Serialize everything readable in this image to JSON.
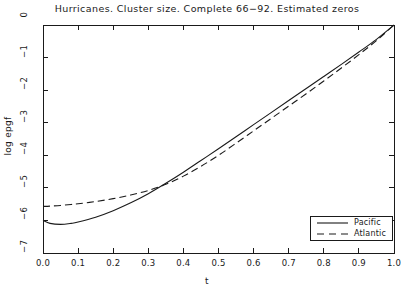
{
  "chart_data": {
    "type": "line",
    "title": "Hurricanes. Cluster size. Complete 66−92. Estimated zeros",
    "xlabel": "t",
    "ylabel": "log epgf",
    "xlim": [
      0.0,
      1.0
    ],
    "ylim": [
      -7,
      0
    ],
    "xticks": [
      "0.0",
      "0.1",
      "0.2",
      "0.3",
      "0.4",
      "0.5",
      "0.6",
      "0.7",
      "0.8",
      "0.9",
      "1.0"
    ],
    "xtick_values": [
      0.0,
      0.1,
      0.2,
      0.3,
      0.4,
      0.5,
      0.6,
      0.7,
      0.8,
      0.9,
      1.0
    ],
    "yticks": [
      "0",
      "−1",
      "−2",
      "−3",
      "−4",
      "−5",
      "−6",
      "−7"
    ],
    "ytick_values": [
      0,
      -1,
      -2,
      -3,
      -4,
      -5,
      -6,
      -7
    ],
    "grid": false,
    "legend_position": "lower right",
    "series": [
      {
        "name": "Pacific",
        "style": "solid",
        "color": "#1a1a1a",
        "x": [
          0.0,
          0.02,
          0.05,
          0.08,
          0.1,
          0.15,
          0.2,
          0.25,
          0.3,
          0.35,
          0.4,
          0.45,
          0.5,
          0.55,
          0.6,
          0.65,
          0.7,
          0.75,
          0.8,
          0.85,
          0.9,
          0.95,
          1.0
        ],
        "values": [
          -6.0,
          -6.09,
          -6.12,
          -6.09,
          -6.05,
          -5.9,
          -5.7,
          -5.46,
          -5.18,
          -4.86,
          -4.52,
          -4.16,
          -3.8,
          -3.43,
          -3.06,
          -2.69,
          -2.32,
          -1.95,
          -1.58,
          -1.21,
          -0.83,
          -0.44,
          0.0
        ]
      },
      {
        "name": "Atlantic",
        "style": "dashed",
        "color": "#1a1a1a",
        "x": [
          0.0,
          0.02,
          0.05,
          0.08,
          0.1,
          0.15,
          0.2,
          0.25,
          0.3,
          0.35,
          0.4,
          0.45,
          0.5,
          0.55,
          0.6,
          0.65,
          0.7,
          0.75,
          0.8,
          0.85,
          0.9,
          0.95,
          1.0
        ],
        "values": [
          -5.57,
          -5.56,
          -5.54,
          -5.51,
          -5.49,
          -5.42,
          -5.33,
          -5.22,
          -5.08,
          -4.89,
          -4.64,
          -4.34,
          -4.0,
          -3.63,
          -3.25,
          -2.87,
          -2.49,
          -2.11,
          -1.72,
          -1.32,
          -0.91,
          -0.48,
          0.0
        ]
      }
    ],
    "legend_entries": [
      {
        "label": "Pacific",
        "style": "solid"
      },
      {
        "label": "Atlantic",
        "style": "dashed"
      }
    ]
  }
}
